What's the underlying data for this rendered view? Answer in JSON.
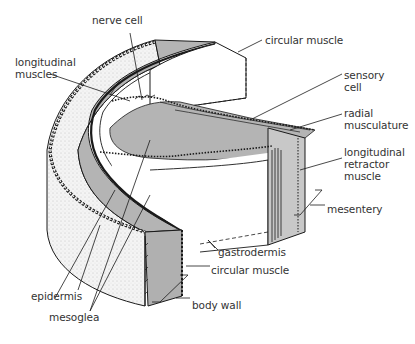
{
  "diagram": {
    "colors": {
      "ink": "#1a1a1a",
      "fill_gray": "#b4b4b4",
      "fill_light": "#f2f2f2",
      "background": "#ffffff",
      "label_text": "#333333"
    },
    "labels": [
      {
        "id": "nerve-cell",
        "text": "nerve cell",
        "x": 92,
        "y": 22
      },
      {
        "id": "circular-muscle-top",
        "text": "circular muscle",
        "x": 265,
        "y": 35
      },
      {
        "id": "longitudinal-muscles",
        "text": "longitudinal\nmuscles",
        "x": 15,
        "y": 56
      },
      {
        "id": "sensory-cell",
        "text": "sensory\ncell",
        "x": 344,
        "y": 69
      },
      {
        "id": "radial-musculature",
        "text": "radial\nmusculature",
        "x": 344,
        "y": 109
      },
      {
        "id": "longitudinal-retractor-muscle",
        "text": "longitudinal\nretractor\nmuscle",
        "x": 344,
        "y": 145
      },
      {
        "id": "mesentery",
        "text": "mesentery",
        "x": 327,
        "y": 203
      },
      {
        "id": "gastrodermis",
        "text": "gastrodermis",
        "x": 218,
        "y": 247
      },
      {
        "id": "circular-muscle-bottom",
        "text": "circular muscle",
        "x": 211,
        "y": 265
      },
      {
        "id": "epidermis",
        "text": "epidermis",
        "x": 31,
        "y": 290
      },
      {
        "id": "body-wall",
        "text": "body wall",
        "x": 192,
        "y": 300
      },
      {
        "id": "mesoglea",
        "text": "mesoglea",
        "x": 49,
        "y": 311
      }
    ]
  }
}
